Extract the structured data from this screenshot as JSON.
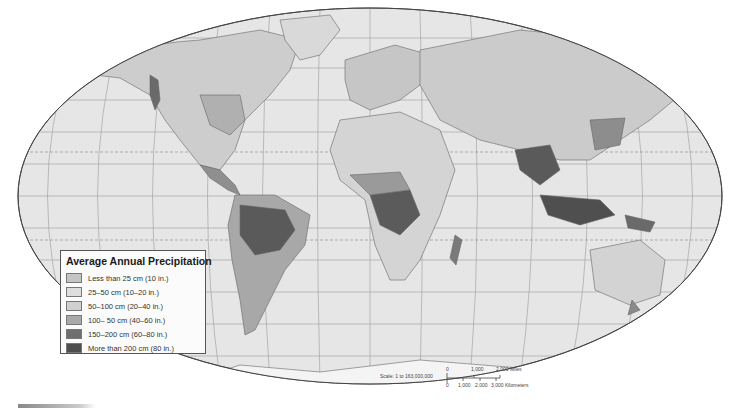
{
  "map": {
    "title": "Average Annual Precipitation",
    "projection": "robinson-like ellipse",
    "ocean_color": "#e4e4e4",
    "land_base_color": "#c8c8c8",
    "grid_color": "#8a8a8a"
  },
  "legend": {
    "title": "Average Annual Precipitation",
    "items": [
      {
        "label": "Less than 25 cm (10 in.)",
        "color": "#c4c4c4"
      },
      {
        "label": "25–50 cm (10–20 in.)",
        "color": "#dedede"
      },
      {
        "label": "50–100 cm (20–40 in.)",
        "color": "#cfcfcf"
      },
      {
        "label": "100– 50 cm (40–60 in.)",
        "color": "#a9a9a9"
      },
      {
        "label": "150–200 cm (60–80 in.)",
        "color": "#6f6f6f"
      },
      {
        "label": "More than 200 cm (80 in.)",
        "color": "#4e4e4e"
      }
    ]
  },
  "scale": {
    "label": "Scale: 1 to 163,000,000",
    "miles_ticks": [
      "0",
      "1,000",
      "2,000 Miles"
    ],
    "km_ticks": [
      "0",
      "1,000",
      "2,000",
      "3,000 Kilometers"
    ]
  }
}
